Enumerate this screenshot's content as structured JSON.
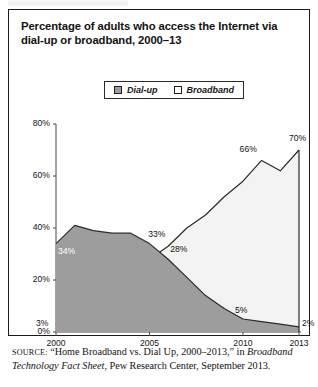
{
  "figure": {
    "title": "Percentage of adults who access the Internet via dial-up or broadband, 2000–13",
    "source_prefix": "SOURCE:",
    "source_part1": " “Home Broadband vs. Dial Up, 2000–2013,” in ",
    "source_italic": "Broadband Technology Fact Sheet",
    "source_part2": ", Pew Research Center, September 2013."
  },
  "legend": {
    "position": "top-center",
    "items": [
      {
        "label": "Dial-up",
        "color": "#9d9d9d",
        "swatch": "filled-gray-square"
      },
      {
        "label": "Broadband",
        "color": "#ffffff",
        "swatch": "empty-white-square"
      }
    ]
  },
  "chart_data": {
    "type": "area",
    "title": "Percentage of adults who access the Internet via dial-up or broadband, 2000–13",
    "xlabel": "",
    "ylabel": "",
    "ylim": [
      0,
      80
    ],
    "xlim": [
      2000,
      2013
    ],
    "grid": false,
    "y_ticks": [
      "0%",
      "20%",
      "40%",
      "60%",
      "80%"
    ],
    "y_tick_values": [
      0,
      20,
      40,
      60,
      80
    ],
    "x_ticks": [
      "2000",
      "2005",
      "2010",
      "2013"
    ],
    "x_tick_values": [
      2000,
      2005,
      2010,
      2013
    ],
    "x": [
      2000,
      2001,
      2002,
      2003,
      2004,
      2005,
      2006,
      2007,
      2008,
      2009,
      2010,
      2011,
      2012,
      2013
    ],
    "series": [
      {
        "name": "Dial-up",
        "values": [
          34,
          41,
          39,
          38,
          38,
          34,
          28,
          21,
          14,
          9,
          5,
          4,
          3,
          2
        ],
        "fill": "#9d9d9d",
        "stroke": "#2b2b2b"
      },
      {
        "name": "Broadband",
        "values": [
          3,
          8,
          12,
          17,
          24,
          28,
          33,
          40,
          45,
          52,
          58,
          66,
          62,
          70
        ],
        "fill": "#f3f3f3",
        "stroke": "#2b2b2b"
      }
    ],
    "annotations": [
      {
        "text": "3%",
        "series": "Broadband",
        "x": 2000,
        "value": 3
      },
      {
        "text": "33%",
        "series": "Broadband",
        "x": 2006,
        "value": 33
      },
      {
        "text": "66%",
        "series": "Broadband",
        "x": 2011,
        "value": 66
      },
      {
        "text": "70%",
        "series": "Broadband",
        "x": 2013,
        "value": 70
      },
      {
        "text": "34%",
        "series": "Dial-up",
        "x": 2000,
        "value": 34
      },
      {
        "text": "28%",
        "series": "Dial-up",
        "x": 2006,
        "value": 28
      },
      {
        "text": "5%",
        "series": "Dial-up",
        "x": 2010,
        "value": 5
      },
      {
        "text": "2%",
        "series": "Dial-up",
        "x": 2013,
        "value": 2
      }
    ]
  }
}
